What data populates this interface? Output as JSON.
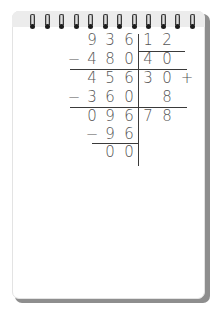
{
  "notepad": {
    "ring_count": 12,
    "colors": {
      "paper": "#ffffff",
      "shadow": "#8e8e8e",
      "ink": "#555555",
      "rule": "#3a3a3a",
      "ring_hole": "#1c1c1c"
    }
  },
  "division": {
    "dividend": "936",
    "divisor": "12",
    "quotient": "78",
    "remainder": "0",
    "rows": [
      {
        "sign": "",
        "digits": [
          "9",
          "3",
          "6"
        ],
        "right": [
          "1",
          "2"
        ],
        "right_sign": ""
      },
      {
        "sign": "−",
        "digits": [
          "4",
          "8",
          "0"
        ],
        "right": [
          "4",
          "0"
        ],
        "right_sign": ""
      },
      {
        "sign": "",
        "digits": [
          "4",
          "5",
          "6"
        ],
        "right": [
          "3",
          "0"
        ],
        "right_sign": "+"
      },
      {
        "sign": "−",
        "digits": [
          "3",
          "6",
          "0"
        ],
        "right": [
          "",
          "8"
        ],
        "right_sign": ""
      },
      {
        "sign": "",
        "digits": [
          "0",
          "9",
          "6"
        ],
        "right": [
          "7",
          "8"
        ],
        "right_sign": ""
      },
      {
        "sign": "−",
        "digits": [
          "",
          "9",
          "6"
        ],
        "right": [
          "",
          ""
        ],
        "right_sign": ""
      },
      {
        "sign": "",
        "digits": [
          "",
          "0",
          "0"
        ],
        "right": [
          "",
          ""
        ],
        "right_sign": ""
      }
    ]
  }
}
